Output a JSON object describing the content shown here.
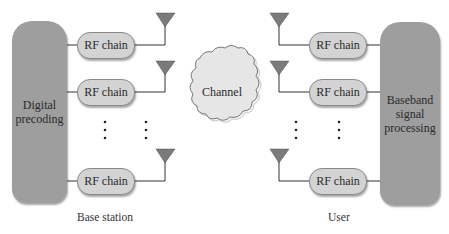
{
  "diagram": {
    "type": "block-diagram",
    "transmitter": {
      "block_label": "Digital precoding",
      "rf_chains": [
        "RF chain",
        "RF chain",
        "RF chain"
      ],
      "section_label": "Base station"
    },
    "channel": {
      "label": "Channel"
    },
    "receiver": {
      "block_label": "Baseband signal processing",
      "rf_chains": [
        "RF chain",
        "RF chain",
        "RF chain"
      ],
      "section_label": "User"
    },
    "ellipsis": "⋮",
    "colors": {
      "block_fill": "#9e9e9e",
      "rf_fill": "#d3d3d3",
      "cloud_fill": "#e6e6e6",
      "antenna_fill": "#7a7a7a",
      "line": "#333333"
    }
  }
}
